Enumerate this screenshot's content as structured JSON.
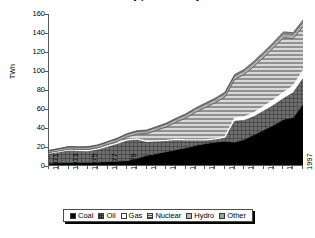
{
  "chart_data": {
    "type": "area",
    "stacked": true,
    "title": "Electricity production by fuel",
    "xlabel": "",
    "ylabel": "TWh",
    "ylim": [
      0,
      160
    ],
    "ytick_step": 20,
    "yticks": [
      160,
      140,
      120,
      100,
      80,
      60,
      40,
      20,
      0
    ],
    "grid": false,
    "legend_position": "bottom",
    "x": [
      1971,
      1972,
      1973,
      1974,
      1975,
      1976,
      1977,
      1978,
      1979,
      1980,
      1981,
      1982,
      1983,
      1984,
      1985,
      1986,
      1987,
      1988,
      1989,
      1990,
      1991,
      1992,
      1993,
      1994,
      1995,
      1996,
      1997
    ],
    "xtick_labels": [
      "1971",
      "1973",
      "1975",
      "1977",
      "1979",
      "1981",
      "1983",
      "1985",
      "1987",
      "1989",
      "1991",
      "1993",
      "1995",
      "1997"
    ],
    "series": [
      {
        "name": "Coal",
        "color": "#000000",
        "pattern": "solid",
        "values": [
          3.0,
          3.2,
          3.5,
          3.6,
          3.8,
          4.0,
          4.5,
          5.0,
          5.5,
          8.0,
          11.0,
          13.0,
          15.0,
          17.0,
          19.0,
          21.5,
          23.5,
          25.0,
          26.0,
          25.0,
          28.0,
          33.0,
          38.0,
          43.0,
          49.0,
          51.0,
          65.0
        ]
      },
      {
        "name": "Oil",
        "color": "#6e6e6e",
        "pattern": "crosshatch",
        "values": [
          10.5,
          12.0,
          13.5,
          13.0,
          12.5,
          14.0,
          16.5,
          19.0,
          22.0,
          20.5,
          15.0,
          13.5,
          12.0,
          11.0,
          8.5,
          6.0,
          4.0,
          3.5,
          4.5,
          22.0,
          20.0,
          19.0,
          20.0,
          21.0,
          22.0,
          26.0,
          27.0
        ]
      },
      {
        "name": "Gas",
        "color": "#ffffff",
        "pattern": "empty",
        "values": [
          0,
          0,
          0,
          0,
          0,
          0,
          0,
          0,
          0,
          0,
          0,
          0,
          0,
          0,
          0,
          0,
          0,
          0,
          0,
          3.0,
          3.5,
          4.0,
          4.5,
          5.5,
          6.0,
          7.0,
          8.0
        ]
      },
      {
        "name": "Nuclear",
        "color": "#8f8f8f",
        "pattern": "horizontal-lines",
        "values": [
          0.5,
          0.6,
          0.7,
          0.8,
          1.0,
          1.2,
          1.5,
          2.0,
          3.0,
          5.0,
          8.0,
          11.0,
          14.0,
          18.0,
          23.0,
          29.0,
          34.0,
          38.0,
          42.0,
          41.0,
          45.0,
          49.0,
          52.0,
          55.0,
          58.0,
          50.0,
          47.0
        ]
      },
      {
        "name": "Hydro",
        "color": "#b4b4b4",
        "pattern": "light-horizontal",
        "values": [
          2.0,
          2.1,
          2.2,
          2.3,
          2.4,
          2.4,
          2.5,
          2.6,
          2.7,
          2.8,
          2.9,
          3.0,
          3.1,
          3.2,
          3.3,
          3.4,
          3.5,
          3.6,
          3.7,
          3.8,
          3.9,
          4.0,
          4.1,
          4.2,
          4.3,
          4.4,
          4.5
        ]
      },
      {
        "name": "Other",
        "color": "#a0a0a0",
        "pattern": "light-gray",
        "values": [
          0.5,
          0.5,
          0.6,
          0.6,
          0.7,
          0.7,
          0.8,
          0.8,
          0.9,
          0.9,
          1.0,
          1.0,
          1.1,
          1.1,
          1.2,
          1.2,
          1.3,
          1.3,
          1.4,
          1.4,
          1.5,
          1.6,
          1.7,
          1.8,
          1.9,
          2.0,
          2.2
        ]
      }
    ],
    "totals": [
      16.5,
      18.4,
      20.5,
      20.3,
      20.4,
      22.3,
      25.8,
      29.4,
      34.1,
      38.2,
      37.9,
      41.5,
      45.2,
      50.3,
      55.0,
      61.1,
      66.3,
      71.4,
      77.6,
      96.2,
      101.9,
      110.6,
      120.3,
      130.5,
      141.2,
      140.4,
      153.7
    ]
  },
  "legend": {
    "items": [
      {
        "label": "Coal"
      },
      {
        "label": "Oil"
      },
      {
        "label": "Gas"
      },
      {
        "label": "Nuclear"
      },
      {
        "label": "Hydro"
      },
      {
        "label": "Other"
      }
    ]
  }
}
